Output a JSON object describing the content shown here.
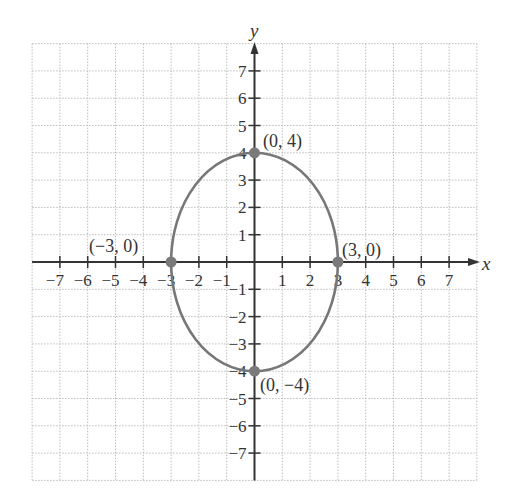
{
  "chart_data": {
    "type": "scatter",
    "title": "",
    "xlabel": "x",
    "ylabel": "y",
    "xlim": [
      -8,
      8
    ],
    "ylim": [
      -8,
      8
    ],
    "grid": true,
    "x_ticks": [
      -7,
      -6,
      -5,
      -4,
      -3,
      -2,
      -1,
      1,
      2,
      3,
      4,
      5,
      6,
      7
    ],
    "y_ticks": [
      -7,
      -6,
      -5,
      -4,
      -3,
      -2,
      -1,
      1,
      2,
      3,
      4,
      5,
      6,
      7
    ],
    "curve": {
      "type": "ellipse",
      "equation": "x^2/9 + y^2/16 = 1",
      "center": [
        0,
        0
      ],
      "semi_axis_x": 3,
      "semi_axis_y": 4,
      "color": "#777777"
    },
    "points": [
      {
        "x": 0,
        "y": 4,
        "label": "(0, 4)"
      },
      {
        "x": 0,
        "y": -4,
        "label": "(0, −4)"
      },
      {
        "x": -3,
        "y": 0,
        "label": "(−3, 0)"
      },
      {
        "x": 3,
        "y": 0,
        "label": "(3, 0)"
      }
    ],
    "point_color": "#7a7a7a",
    "axis_color": "#333333",
    "grid_color": "#bdbdbd"
  },
  "labels": {
    "x_axis": "x",
    "y_axis": "y",
    "p_top": "(0, 4)",
    "p_bottom": "(0, −4)",
    "p_left": "(−3, 0)",
    "p_right": "(3, 0)"
  }
}
